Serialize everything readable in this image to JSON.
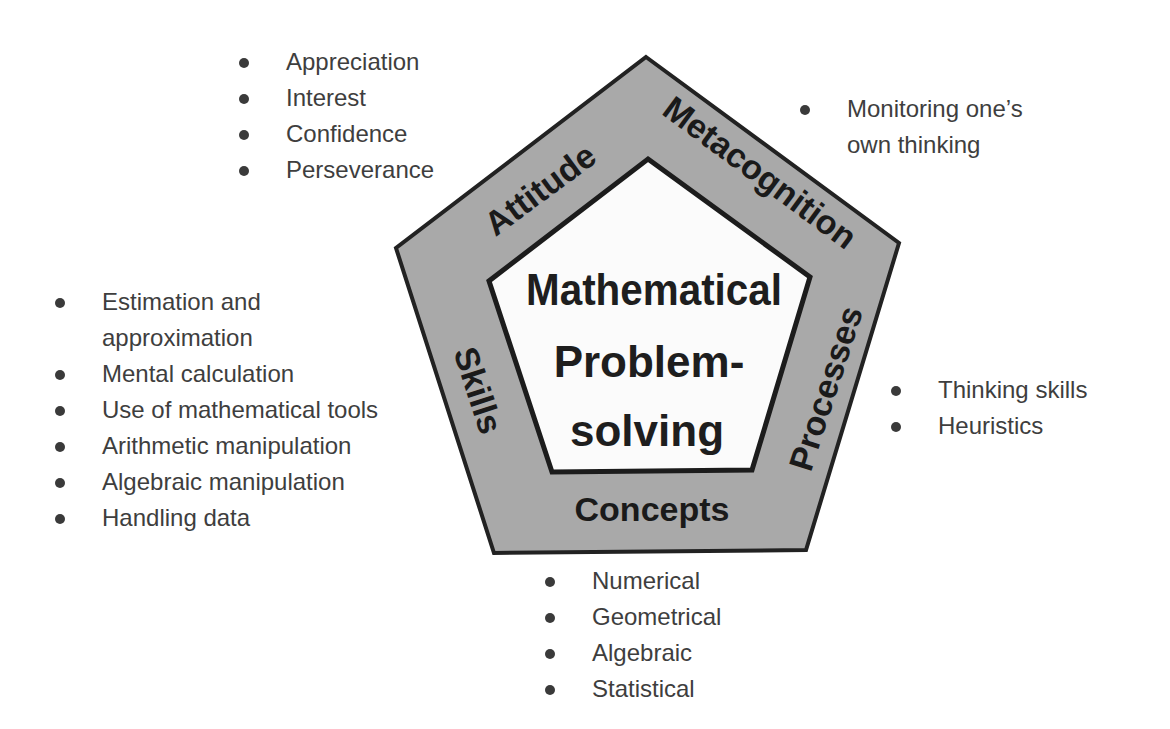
{
  "diagram": {
    "center": {
      "lines": [
        "Mathematical",
        "Problem-",
        "solving"
      ]
    },
    "colors": {
      "outer_fill": "#a9a9a9",
      "inner_fill": "#fbfbfb",
      "stroke": "#222222",
      "text": "#1a1a1a",
      "bullet_text": "#3e3e3e"
    },
    "sides": {
      "attitude": "Attitude",
      "metacognition": "Metacognition",
      "processes": "Processes",
      "concepts": "Concepts",
      "skills": "Skills"
    },
    "lists": {
      "attitude": [
        "Appreciation",
        "Interest",
        "Confidence",
        "Perseverance"
      ],
      "metacognition": [
        "Monitoring one’s own thinking"
      ],
      "skills": [
        "Estimation and approximation",
        "Mental calculation",
        "Use of mathematical tools",
        "Arithmetic manipulation",
        "Algebraic manipulation",
        "Handling data"
      ],
      "processes": [
        "Thinking skills",
        "Heuristics"
      ],
      "concepts": [
        "Numerical",
        "Geometrical",
        "Algebraic",
        "Statistical"
      ]
    },
    "skills_first_item_lines": [
      "Estimation and",
      "approximation"
    ],
    "metacognition_item_lines": [
      "Monitoring one’s",
      "own thinking"
    ]
  }
}
